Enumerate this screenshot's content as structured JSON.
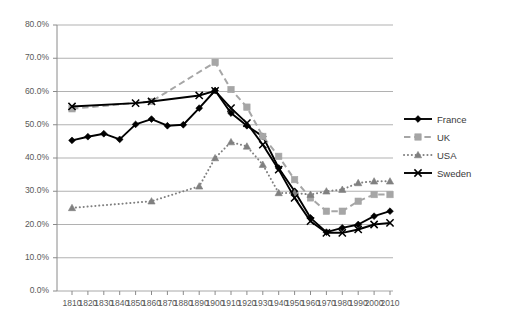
{
  "chart_data": {
    "type": "line",
    "title": "",
    "subtitle": "",
    "xlabel": "",
    "ylabel": "",
    "xlim": [
      1810,
      2010
    ],
    "ylim": [
      0,
      80
    ],
    "grid": true,
    "legend_position": "right",
    "x": [
      1810,
      1820,
      1830,
      1840,
      1850,
      1860,
      1870,
      1880,
      1890,
      1900,
      1910,
      1920,
      1930,
      1940,
      1950,
      1960,
      1970,
      1980,
      1990,
      2000,
      2010
    ],
    "xtick_labels": [
      "1810",
      "1820",
      "1830",
      "1840",
      "1850",
      "1860",
      "1870",
      "1880",
      "1890",
      "1900",
      "1910",
      "1920",
      "1930",
      "1940",
      "1950",
      "1960",
      "1970",
      "1980",
      "1990",
      "2000",
      "2010"
    ],
    "ytick_labels": [
      "0.0%",
      "10.0%",
      "20.0%",
      "30.0%",
      "40.0%",
      "50.0%",
      "60.0%",
      "70.0%",
      "80.0%"
    ],
    "ytick_values": [
      0,
      10,
      20,
      30,
      40,
      50,
      60,
      70,
      80
    ],
    "series": [
      {
        "name": "France",
        "color": "#000000",
        "line_style": "solid",
        "marker": "diamond",
        "x": [
          1810,
          1820,
          1830,
          1840,
          1850,
          1860,
          1870,
          1880,
          1890,
          1900,
          1910,
          1920,
          1930,
          1940,
          1950,
          1960,
          1970,
          1980,
          1990,
          2000,
          2010
        ],
        "values": [
          45.3,
          46.4,
          47.3,
          45.6,
          50.1,
          51.7,
          49.7,
          50.0,
          55.0,
          60.3,
          53.5,
          49.7,
          46.5,
          37.0,
          30.0,
          22.0,
          17.7,
          19.0,
          20.0,
          22.5,
          24.0
        ]
      },
      {
        "name": "UK",
        "color": "#a6a6a6",
        "line_style": "dashed",
        "marker": "square",
        "x": [
          1810,
          1860,
          1900,
          1910,
          1920,
          1930,
          1940,
          1950,
          1960,
          1970,
          1980,
          1990,
          2000,
          2010
        ],
        "values": [
          54.8,
          57.0,
          68.8,
          60.6,
          55.3,
          46.5,
          40.5,
          33.5,
          28.0,
          24.0,
          24.0,
          27.0,
          29.0,
          29.0
        ]
      },
      {
        "name": "USA",
        "color": "#808080",
        "line_style": "dotted",
        "marker": "triangle",
        "x": [
          1810,
          1860,
          1890,
          1900,
          1910,
          1920,
          1930,
          1940,
          1950,
          1960,
          1970,
          1980,
          1990,
          2000,
          2010
        ],
        "values": [
          25.0,
          27.0,
          31.5,
          40.0,
          44.8,
          43.5,
          38.0,
          29.5,
          29.5,
          29.0,
          30.0,
          30.5,
          32.5,
          33.0,
          33.0
        ]
      },
      {
        "name": "Sweden",
        "color": "#000000",
        "line_style": "solid",
        "marker": "x",
        "x": [
          1810,
          1850,
          1860,
          1890,
          1900,
          1910,
          1920,
          1930,
          1940,
          1950,
          1960,
          1970,
          1980,
          1990,
          2000,
          2010
        ],
        "values": [
          55.5,
          56.5,
          57.0,
          58.8,
          60.2,
          55.0,
          50.5,
          44.0,
          36.5,
          28.0,
          21.0,
          17.5,
          17.5,
          18.5,
          20.0,
          20.5
        ]
      }
    ]
  },
  "legend": {
    "items": [
      {
        "label": "France"
      },
      {
        "label": "UK"
      },
      {
        "label": "USA"
      },
      {
        "label": "Sweden"
      }
    ]
  }
}
